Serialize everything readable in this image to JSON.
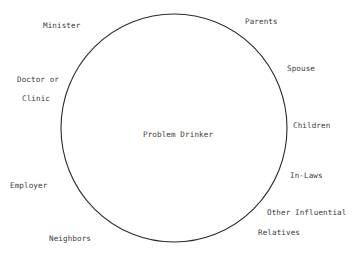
{
  "diagram": {
    "center_label": "Problem Drinker",
    "circle_color": "#2a2a2a",
    "text_color": "#3c3c3c",
    "surrounding_labels": {
      "minister": "Minister",
      "parents": "Parents",
      "doctor_line1": "Doctor or",
      "doctor_line2": "Clinic",
      "spouse": "Spouse",
      "children": "Children",
      "employer": "Employer",
      "in_laws": "In-Laws",
      "other_influential": "Other Influential",
      "relatives": "Relatives",
      "neighbors": "Neighbors"
    }
  }
}
